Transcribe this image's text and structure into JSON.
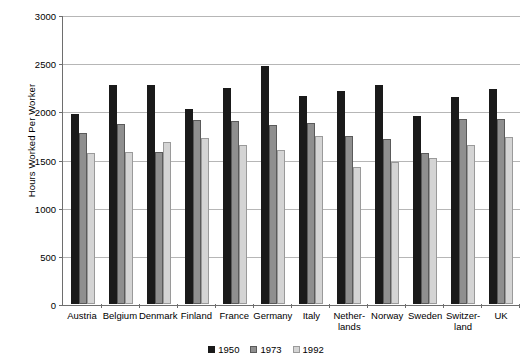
{
  "chart_data": {
    "type": "bar",
    "title": "",
    "xlabel": "",
    "ylabel": "Hours Worked Per Worker",
    "ylim": [
      0,
      3000
    ],
    "yticks": [
      0,
      500,
      1000,
      1500,
      2000,
      2500,
      3000
    ],
    "ytick_labels": [
      "0",
      "500",
      "1000",
      "1500",
      "2000",
      "2500",
      "3000"
    ],
    "grid": true,
    "legend_position": "bottom-center",
    "categories": [
      "Austria",
      "Belgium",
      "Denmark",
      "Finland",
      "France",
      "Germany",
      "Italy",
      "Nether-\nlands",
      "Norway",
      "Sweden",
      "Switzer-\nland",
      "UK"
    ],
    "series": [
      {
        "name": "1950",
        "color": "#1a1a1a",
        "values": [
          1976,
          2283,
          2283,
          2035,
          2255,
          2475,
          2166,
          2215,
          2283,
          1960,
          2156,
          2235
        ]
      },
      {
        "name": "1973",
        "color": "#8f8f8f",
        "values": [
          1778,
          1872,
          1583,
          1915,
          1904,
          1868,
          1888,
          1751,
          1721,
          1571,
          1930,
          1929
        ]
      },
      {
        "name": "1992",
        "color": "#d4d4d4",
        "values": [
          1576,
          1581,
          1689,
          1730,
          1656,
          1604,
          1746,
          1424,
          1481,
          1516,
          1658,
          1740
        ]
      }
    ]
  },
  "legend": {
    "items": [
      {
        "label": "1950",
        "swatch": "series-0-swatch"
      },
      {
        "label": "1973",
        "swatch": "series-1-swatch"
      },
      {
        "label": "1992",
        "swatch": "series-2-swatch"
      }
    ]
  }
}
